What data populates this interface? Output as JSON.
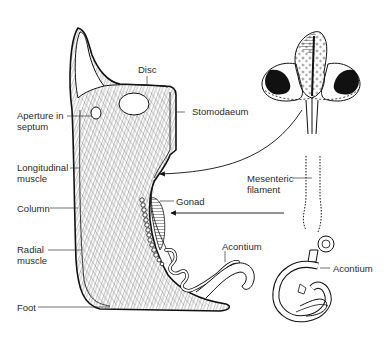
{
  "diagram": {
    "labels": {
      "disc": "Disc",
      "stomodaeum": "Stomodaeum",
      "aperture_in_septum": "Aperture in\nseptum",
      "longitudinal_muscle": "Longitudinal\nmuscle",
      "column": "Column",
      "radial_muscle": "Radial\nmuscle",
      "foot": "Foot",
      "gonad": "Gonad",
      "acontium_left": "Acontium",
      "mesenteric_filament": "Mesenteric\nfilament",
      "acontium_right": "Acontium"
    },
    "colors": {
      "ink": "#1a1a1a",
      "background": "#ffffff",
      "label": "#2a2a2a"
    }
  }
}
